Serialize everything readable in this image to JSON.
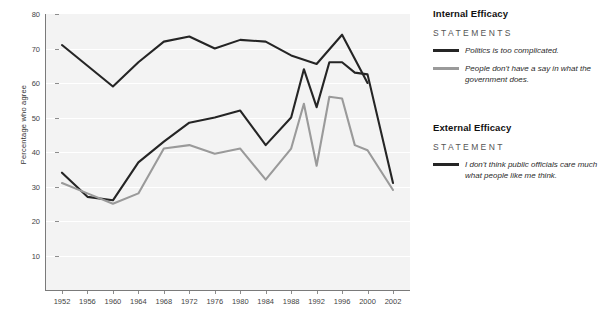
{
  "chart_data": {
    "type": "line",
    "title": "",
    "xlabel": "",
    "ylabel": "Percentage who agree",
    "xlim": [
      1952,
      2002
    ],
    "ylim": [
      0,
      80
    ],
    "yticks": [
      0,
      10,
      20,
      30,
      40,
      50,
      60,
      70,
      80
    ],
    "ytick_labels": [
      "",
      "10",
      "20",
      "30",
      "40",
      "50",
      "60",
      "70",
      "80"
    ],
    "xticks": [
      1952,
      1956,
      1960,
      1964,
      1968,
      1972,
      1976,
      1980,
      1984,
      1988,
      1992,
      1996,
      2000,
      2002
    ],
    "xtick_labels": [
      "1952",
      "1956",
      "1960",
      "1964",
      "1968",
      "1972",
      "1976",
      "1980",
      "1984",
      "1988",
      "1992",
      "1996",
      "2000",
      "2002"
    ],
    "grid": "horizontal-white",
    "legend_position": "right",
    "series": [
      {
        "name": "I don't think public officials care much what people like me think.",
        "group": "External Efficacy",
        "color": "#252525",
        "x": [
          1952,
          1956,
          1960,
          1964,
          1968,
          1972,
          1976,
          1980,
          1984,
          1988,
          1992,
          1996,
          2000
        ],
        "values": [
          71,
          65,
          59,
          66,
          72,
          73.5,
          70,
          72.5,
          72,
          68,
          65.5,
          74,
          60
        ]
      },
      {
        "name": "Politics is too complicated.",
        "group": "Internal Efficacy",
        "color": "#252525",
        "x": [
          1952,
          1956,
          1960,
          1964,
          1968,
          1972,
          1976,
          1980,
          1984,
          1988,
          1990,
          1992,
          1994,
          1996,
          1998,
          2000,
          2002
        ],
        "values": [
          34,
          27,
          26,
          37,
          43,
          48.5,
          50,
          52,
          42,
          50,
          64,
          53,
          66,
          66,
          63,
          62.5,
          31
        ]
      },
      {
        "name": "People don't have a say in what the government does.",
        "group": "Internal Efficacy",
        "color": "#9a9a9a",
        "x": [
          1952,
          1956,
          1960,
          1964,
          1968,
          1972,
          1976,
          1980,
          1984,
          1988,
          1990,
          1992,
          1994,
          1996,
          1998,
          2000,
          2002
        ],
        "values": [
          31,
          28,
          25,
          28,
          41,
          42,
          39.5,
          41,
          32,
          41,
          54,
          36,
          56,
          55.5,
          42,
          40.5,
          29
        ]
      }
    ]
  },
  "legend": {
    "groups": [
      {
        "heading": "Internal Efficacy",
        "sub": "STATEMENTS",
        "entries": [
          {
            "label": "Politics is too complicated.",
            "color": "#252525"
          },
          {
            "label": "People don't have a say in what the government does.",
            "color": "#9a9a9a"
          }
        ]
      },
      {
        "heading": "External Efficacy",
        "sub": "STATEMENT",
        "entries": [
          {
            "label": "I don't think public officials care much what people like me think.",
            "color": "#252525"
          }
        ]
      }
    ]
  }
}
